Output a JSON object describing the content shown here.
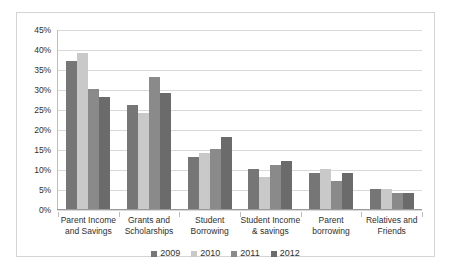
{
  "chart_data": {
    "type": "bar",
    "title": "",
    "subtitle": "",
    "xlabel": "",
    "ylabel": "",
    "ylim": [
      0,
      45
    ],
    "ytick_labels": [
      "45%",
      "40%",
      "35%",
      "30%",
      "25%",
      "20%",
      "15%",
      "10%",
      "5%",
      "0%"
    ],
    "ytick_values": [
      45,
      40,
      35,
      30,
      25,
      20,
      15,
      10,
      5,
      0
    ],
    "grid": true,
    "legend_position": "bottom-center",
    "categories": [
      "Parent Income and Savings",
      "Grants and Scholarships",
      "Student Borrowing",
      "Student Income & savings",
      "Parent borrowing",
      "Relatives and Friends"
    ],
    "category_lines": [
      [
        "Parent Income",
        "and Savings"
      ],
      [
        "Grants and",
        "Scholarships"
      ],
      [
        "Student",
        "Borrowing"
      ],
      [
        "Student Income",
        "& savings"
      ],
      [
        "Parent",
        "borrowing"
      ],
      [
        "Relatives and",
        "Friends"
      ]
    ],
    "series": [
      {
        "name": "2009",
        "color": "#767676",
        "values": [
          37,
          26,
          13,
          10,
          9,
          5
        ]
      },
      {
        "name": "2010",
        "color": "#c9c9c9",
        "values": [
          39,
          24,
          14,
          8,
          10,
          5
        ]
      },
      {
        "name": "2011",
        "color": "#8a8a8a",
        "values": [
          30,
          33,
          15,
          11,
          7,
          4
        ]
      },
      {
        "name": "2012",
        "color": "#6b6b6b",
        "values": [
          28,
          29,
          18,
          12,
          9,
          4
        ]
      }
    ]
  }
}
